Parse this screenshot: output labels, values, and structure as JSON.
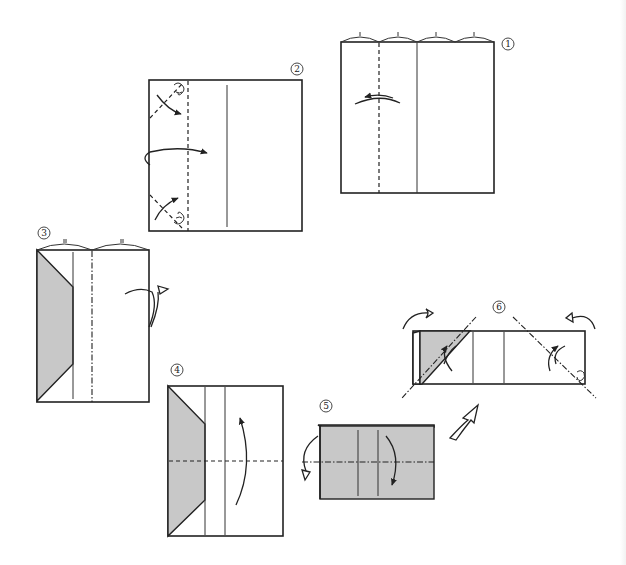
{
  "figure": {
    "type": "origami folding diagram",
    "steps": [
      {
        "id": "1",
        "label": "①",
        "description": "Square divided in quarters; valley fold at left quarter line, fold left edge over",
        "fold_lines": [
          "valley"
        ],
        "arrows": [
          "fold-left"
        ]
      },
      {
        "id": "2",
        "label": "②",
        "description": "Fold corners to inner crease, then turn flap over to the right",
        "fold_lines": [
          "valley-diagonal-top",
          "valley-diagonal-bottom",
          "valley-vertical"
        ],
        "arrows": [
          "corner-top",
          "corner-bottom",
          "flip-right"
        ]
      },
      {
        "id": "3",
        "label": "③",
        "description": "Mountain fold at center line behind",
        "fold_lines": [
          "mountain"
        ],
        "arrows": [
          "fold-behind"
        ]
      },
      {
        "id": "4",
        "label": "④",
        "description": "Valley fold in half horizontally, bottom up",
        "fold_lines": [
          "valley-horizontal"
        ],
        "arrows": [
          "fold-up"
        ]
      },
      {
        "id": "5",
        "label": "⑤",
        "description": "Fold front and back flaps down along line",
        "fold_lines": [
          "mountain-horizontal"
        ],
        "arrows": [
          "fold-back",
          "fold-down"
        ]
      },
      {
        "id": "6",
        "label": "⑥",
        "description": "Fold both ends along diagonals, inside reverse",
        "fold_lines": [
          "mountain-diagonal-left",
          "mountain-diagonal-right"
        ],
        "arrows": [
          "hollow-left",
          "hollow-right",
          "fold-left",
          "fold-right"
        ]
      }
    ],
    "transition_arrow": "hollow-arrow-5-to-6"
  },
  "labels": {
    "s1": "1",
    "s2": "2",
    "s3": "3",
    "s4": "4",
    "s5": "5",
    "s6": "6"
  },
  "colors": {
    "line": "#222222",
    "shade": "#c8c8c8",
    "background": "#ffffff"
  }
}
